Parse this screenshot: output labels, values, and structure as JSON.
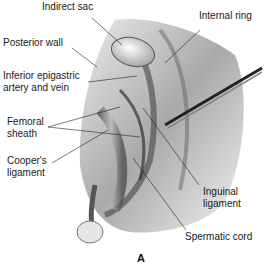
{
  "figure": {
    "panel_letter": "A",
    "labels": {
      "indirect_sac": "Indirect sac",
      "internal_ring": "Internal ring",
      "posterior_wall": "Posterior wall",
      "inferior_epigastric_1": "Inferior epigastric",
      "inferior_epigastric_2": "artery and vein",
      "femoral_sheath_1": "Femoral",
      "femoral_sheath_2": "sheath",
      "coopers_ligament_1": "Cooper's",
      "coopers_ligament_2": "ligament",
      "inguinal_ligament_1": "Inguinal",
      "inguinal_ligament_2": "ligament",
      "spermatic_cord": "Spermatic cord"
    }
  }
}
